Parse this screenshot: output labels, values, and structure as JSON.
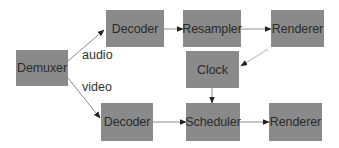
{
  "diagram": {
    "type": "flowchart",
    "colors": {
      "node_fill": "#8a8a8a",
      "node_text": "#2b2b2b",
      "edge": "#8c8c8c",
      "arrowhead": "#222222",
      "background": "#ffffff"
    },
    "nodes": {
      "demuxer": {
        "label": "Demuxer"
      },
      "audio_decoder": {
        "label": "Decoder"
      },
      "resampler": {
        "label": "Resampler"
      },
      "audio_renderer": {
        "label": "Renderer"
      },
      "clock": {
        "label": "Clock"
      },
      "video_decoder": {
        "label": "Decoder"
      },
      "scheduler": {
        "label": "Scheduler"
      },
      "video_renderer": {
        "label": "Renderer"
      }
    },
    "edge_labels": {
      "audio": "audio",
      "video": "video"
    },
    "edges": [
      {
        "from": "demuxer",
        "to": "audio_decoder",
        "label": "audio"
      },
      {
        "from": "demuxer",
        "to": "video_decoder",
        "label": "video"
      },
      {
        "from": "audio_decoder",
        "to": "resampler"
      },
      {
        "from": "resampler",
        "to": "audio_renderer"
      },
      {
        "from": "audio_renderer",
        "to": "clock"
      },
      {
        "from": "clock",
        "to": "scheduler"
      },
      {
        "from": "video_decoder",
        "to": "scheduler"
      },
      {
        "from": "scheduler",
        "to": "video_renderer"
      }
    ]
  }
}
